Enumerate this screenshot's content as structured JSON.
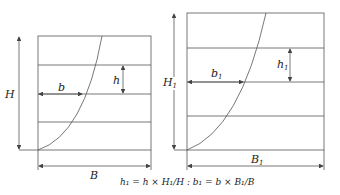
{
  "left_diagram": {
    "height_label": "H",
    "width_label": "B",
    "spacing_label": "h",
    "offset_label": "b"
  },
  "right_diagram": {
    "height_label": "H",
    "height_sub": "1",
    "width_label": "B",
    "width_sub": "1",
    "spacing_label": "h",
    "spacing_sub": "1",
    "offset_label": "b",
    "offset_sub": "1"
  },
  "formula": "h₁ = h × H₁/H : b₁ = b × B₁/B",
  "colors": {
    "line": "#444444",
    "text": "#222222"
  }
}
